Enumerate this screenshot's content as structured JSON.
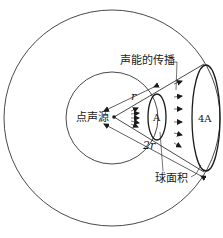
{
  "diagram": {
    "labels": {
      "source": "点声源",
      "propagation": "声能的传播",
      "sphere_area": "球面积",
      "distance_r": "r",
      "distance_2r": "2r",
      "area_small": "A",
      "area_large": "4A"
    },
    "colors": {
      "stroke": "#1a1a1a",
      "background": "#ffffff"
    }
  }
}
